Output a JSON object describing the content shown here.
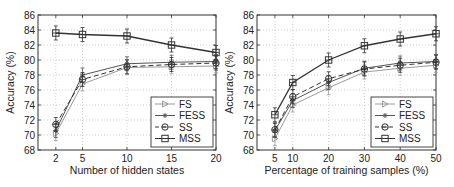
{
  "chart_data": [
    {
      "type": "line",
      "title": "",
      "xlabel": "Number of hidden states",
      "ylabel": "Accuracy (%)",
      "x": [
        2,
        5,
        10,
        15,
        20
      ],
      "xticks": [
        2,
        5,
        10,
        15,
        20
      ],
      "xlim": [
        0,
        20
      ],
      "ylim": [
        68,
        86
      ],
      "yticks": [
        68,
        70,
        72,
        74,
        76,
        78,
        80,
        82,
        84,
        86
      ],
      "grid": true,
      "legend_position": "lower right",
      "series": [
        {
          "name": "FS",
          "values": [
            70.2,
            76.8,
            79.0,
            79.1,
            79.2
          ],
          "color": "#9a9a9a",
          "marker": "triangle-right",
          "dash": "solid"
        },
        {
          "name": "FESS",
          "values": [
            70.6,
            78.0,
            79.5,
            79.7,
            79.8
          ],
          "color": "#555555",
          "marker": "star",
          "dash": "solid"
        },
        {
          "name": "SS",
          "values": [
            71.4,
            77.4,
            79.1,
            79.4,
            79.6
          ],
          "color": "#333333",
          "marker": "circle-bar",
          "dash": "dashed"
        },
        {
          "name": "MSS",
          "values": [
            83.6,
            83.4,
            83.2,
            82.0,
            81.0
          ],
          "color": "#333333",
          "marker": "square",
          "dash": "solid"
        }
      ]
    },
    {
      "type": "line",
      "title": "",
      "xlabel": "Percentage of training samples (%)",
      "ylabel": "Accuracy (%)",
      "x": [
        5,
        10,
        20,
        30,
        40,
        50
      ],
      "xticks": [
        5,
        10,
        20,
        30,
        40,
        50
      ],
      "xlim": [
        0,
        50
      ],
      "ylim": [
        68,
        86
      ],
      "yticks": [
        68,
        70,
        72,
        74,
        76,
        78,
        80,
        82,
        84,
        86
      ],
      "grid": true,
      "legend_position": "lower right",
      "series": [
        {
          "name": "FS",
          "values": [
            69.5,
            74.0,
            76.3,
            78.4,
            78.9,
            79.3
          ],
          "color": "#9a9a9a",
          "marker": "triangle-right",
          "dash": "solid"
        },
        {
          "name": "FESS",
          "values": [
            70.6,
            74.6,
            77.0,
            78.9,
            79.6,
            79.8
          ],
          "color": "#555555",
          "marker": "star",
          "dash": "solid"
        },
        {
          "name": "SS",
          "values": [
            70.7,
            75.1,
            77.5,
            78.8,
            79.3,
            79.7
          ],
          "color": "#333333",
          "marker": "circle-bar",
          "dash": "dashed"
        },
        {
          "name": "MSS",
          "values": [
            72.7,
            77.0,
            80.0,
            81.9,
            82.8,
            83.5
          ],
          "color": "#333333",
          "marker": "square",
          "dash": "solid"
        }
      ]
    }
  ]
}
